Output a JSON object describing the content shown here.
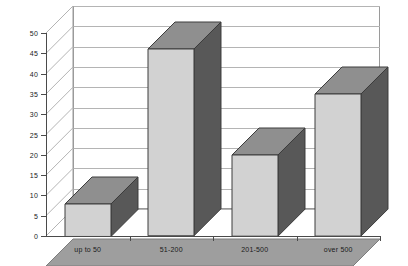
{
  "chart_data": {
    "type": "bar",
    "title": "",
    "subtitle": "",
    "xlabel": "",
    "ylabel": "",
    "categories": [
      "up to 50",
      "51-200",
      "201-500",
      "over 500"
    ],
    "values": [
      8,
      46,
      20,
      35
    ],
    "series": [
      {
        "name": "",
        "values": [
          8,
          46,
          20,
          35
        ]
      }
    ],
    "ylim": [
      0,
      50
    ],
    "ytick_values": [
      0,
      5,
      10,
      15,
      20,
      25,
      30,
      35,
      40,
      45,
      50
    ],
    "ytick_labels": [
      "0",
      "5",
      "10",
      "15",
      "20",
      "25",
      "30",
      "35",
      "40",
      "45",
      "50"
    ],
    "grid": true,
    "grid_axis": "y",
    "legend": false,
    "legend_position": "none",
    "three_d": true,
    "annotations": []
  },
  "style": {
    "bar_front_color": "#d2d2d2",
    "bar_side_color": "#585858",
    "bar_top_color": "#8f8f8f",
    "bar_outline_color": "#3c3c3c",
    "floor_color": "#9e9e9e",
    "floor_front_color": "#b5b5b5",
    "wall_color": "#ffffff",
    "gridline_color": "#b4b4b4",
    "axis_color": "#4a4a4a",
    "text_color": "#1a1a1a",
    "background_color": "#ffffff"
  }
}
